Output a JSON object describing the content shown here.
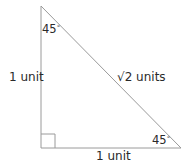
{
  "diagram": {
    "type": "right-triangle",
    "vertices": {
      "top": {
        "x": 41,
        "y": 6
      },
      "bottom_left": {
        "x": 41,
        "y": 148
      },
      "bottom_right": {
        "x": 181,
        "y": 148
      }
    },
    "right_angle_marker": {
      "size": 14
    },
    "stroke_color": "#9a9a9a",
    "labels": {
      "left_side": "1 unit",
      "bottom_side": "1 unit",
      "hypotenuse_radical": "√",
      "hypotenuse_value": "2 units",
      "top_angle": "45",
      "bottom_right_angle": "45",
      "degree_symbol": "°"
    }
  }
}
